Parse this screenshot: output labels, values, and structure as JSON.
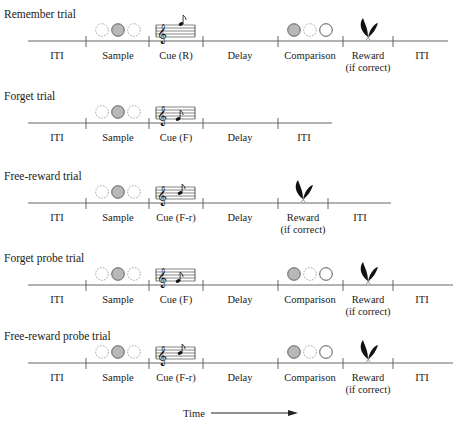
{
  "diagram": {
    "time_label": "Time",
    "trials": [
      {
        "title": "Remember trial",
        "line_y": 41,
        "line_x1": 28,
        "line_x2": 448,
        "ticks": [
          86,
          149,
          203,
          278,
          343,
          393
        ],
        "segments": [
          {
            "label": "ITI",
            "x": 57
          },
          {
            "label": "Sample",
            "x": 118
          },
          {
            "label": "Cue (R)",
            "x": 176
          },
          {
            "label": "Delay",
            "x": 240
          },
          {
            "label": "Comparison",
            "x": 310
          },
          {
            "label": "Reward",
            "sub": "(if correct)",
            "x": 368
          },
          {
            "label": "ITI",
            "x": 422
          }
        ],
        "sample_x": 118,
        "cue": {
          "x": 176,
          "type": "R"
        },
        "comparison_x": 310,
        "reward_x": 368
      },
      {
        "title": "Forget trial",
        "line_y": 123,
        "line_x1": 28,
        "line_x2": 332,
        "ticks": [
          86,
          149,
          203,
          278
        ],
        "segments": [
          {
            "label": "ITI",
            "x": 57
          },
          {
            "label": "Sample",
            "x": 118
          },
          {
            "label": "Cue (F)",
            "x": 176
          },
          {
            "label": "Delay",
            "x": 240
          },
          {
            "label": "ITI",
            "x": 304
          }
        ],
        "sample_x": 118,
        "cue": {
          "x": 176,
          "type": "F"
        }
      },
      {
        "title": "Free-reward trial",
        "line_y": 203,
        "line_x1": 28,
        "line_x2": 391,
        "ticks": [
          86,
          149,
          203,
          278,
          328
        ],
        "segments": [
          {
            "label": "ITI",
            "x": 57
          },
          {
            "label": "Sample",
            "x": 118
          },
          {
            "label": "Cue (F-r)",
            "x": 176
          },
          {
            "label": "Delay",
            "x": 240
          },
          {
            "label": "Reward",
            "sub": "(if correct)",
            "x": 303
          },
          {
            "label": "ITI",
            "x": 360
          }
        ],
        "sample_x": 118,
        "cue": {
          "x": 176,
          "type": "Fr"
        },
        "reward_x": 303
      },
      {
        "title": "Forget probe trial",
        "line_y": 285,
        "line_x1": 28,
        "line_x2": 453,
        "ticks": [
          86,
          149,
          203,
          278,
          343,
          393
        ],
        "segments": [
          {
            "label": "ITI",
            "x": 57
          },
          {
            "label": "Sample",
            "x": 118
          },
          {
            "label": "Cue (F)",
            "x": 176
          },
          {
            "label": "Delay",
            "x": 240
          },
          {
            "label": "Comparison",
            "x": 310
          },
          {
            "label": "Reward",
            "sub": "(if correct)",
            "x": 368
          },
          {
            "label": "ITI",
            "x": 422
          }
        ],
        "sample_x": 118,
        "cue": {
          "x": 176,
          "type": "F"
        },
        "comparison_x": 310,
        "reward_x": 368
      },
      {
        "title": "Free-reward probe trial",
        "line_y": 363,
        "line_x1": 28,
        "line_x2": 453,
        "ticks": [
          86,
          149,
          203,
          278,
          343,
          393
        ],
        "segments": [
          {
            "label": "ITI",
            "x": 57
          },
          {
            "label": "Sample",
            "x": 118
          },
          {
            "label": "Cue (F-r)",
            "x": 176
          },
          {
            "label": "Delay",
            "x": 240
          },
          {
            "label": "Comparison",
            "x": 310
          },
          {
            "label": "Reward",
            "sub": "(if correct)",
            "x": 368
          },
          {
            "label": "ITI",
            "x": 422
          }
        ],
        "sample_x": 118,
        "cue": {
          "x": 176,
          "type": "Fr"
        },
        "comparison_x": 310,
        "reward_x": 368
      }
    ]
  }
}
